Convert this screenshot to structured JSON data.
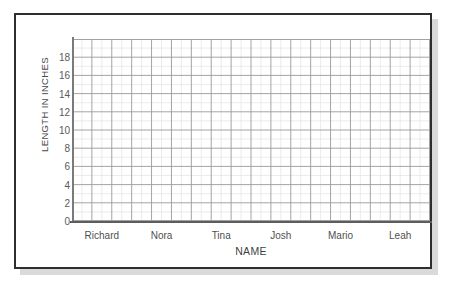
{
  "chart_data": {
    "type": "bar",
    "title": "",
    "subtitle": "",
    "xlabel": "NAME",
    "ylabel": "LENGTH IN INCHES",
    "categories": [
      "Richard",
      "Nora",
      "Tina",
      "Josh",
      "Mario",
      "Leah"
    ],
    "values": [
      null,
      null,
      null,
      null,
      null,
      null
    ],
    "series": [
      {
        "name": "Length in inches",
        "values": [
          null,
          null,
          null,
          null,
          null,
          null
        ]
      }
    ],
    "ytick_labels": [
      "0",
      "2",
      "4",
      "6",
      "8",
      "10",
      "12",
      "14",
      "16",
      "18"
    ],
    "ytick_values": [
      0,
      2,
      4,
      6,
      8,
      10,
      12,
      14,
      16,
      18
    ],
    "ylim": [
      0,
      20
    ],
    "ytick_step": 2,
    "grid": true,
    "grid_major_columns": 18,
    "grid_major_rows": 10,
    "grid_minor_subdivisions": 2,
    "legend": "none",
    "legend_position": "none",
    "annotations": [],
    "note": "Blank grid worksheet — no bars plotted; students fill in data."
  },
  "panel": {
    "border_color": "#2e2e2e",
    "background": "#ffffff",
    "shadow_color": "#bdbdbd"
  },
  "colors": {
    "grid_major": "#9a9a9a",
    "grid_minor": "#e2e2e2",
    "axis": "#5d5d5d",
    "text": "#4a4a4a",
    "page_background": "#ffffff"
  }
}
